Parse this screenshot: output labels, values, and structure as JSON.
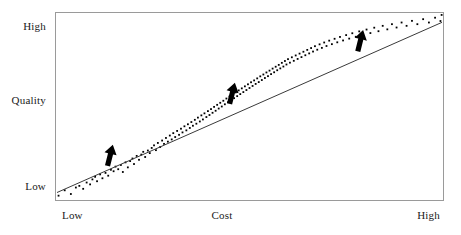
{
  "axes": {
    "y": {
      "name": "Quality",
      "high_label": "High",
      "mid_label": "Quality",
      "low_label": "Low"
    },
    "x": {
      "name": "Cost",
      "low_label": "Low",
      "mid_label": "Cost",
      "high_label": "High"
    }
  },
  "colors": {
    "frame": "#9a9a9a",
    "point": "#000000",
    "trend_line": "#3a3a3a",
    "arrow": "#000000",
    "background": "#ffffff",
    "text": "#1a1a1a"
  },
  "chart_data": {
    "type": "scatter",
    "title": "",
    "xlabel": "Cost",
    "ylabel": "Quality",
    "xlim": [
      0,
      1
    ],
    "ylim": [
      0,
      1
    ],
    "grid": false,
    "legend": null,
    "xtick_labels": [
      "Low",
      "Cost",
      "High"
    ],
    "ytick_labels": [
      "Low",
      "Quality",
      "High"
    ],
    "xtick_positions": [
      0.0,
      0.5,
      1.0
    ],
    "ytick_positions": [
      0.0,
      0.5,
      1.0
    ],
    "trend_line": {
      "x": [
        0.0,
        1.0
      ],
      "y": [
        0.035,
        0.955
      ],
      "slope": 0.92,
      "intercept": 0.035
    },
    "annotations": [
      {
        "label": "arrow-up-1",
        "x": 0.135,
        "y": 0.21,
        "direction": "up-right"
      },
      {
        "label": "arrow-up-2",
        "x": 0.452,
        "y": 0.545,
        "direction": "up-right"
      },
      {
        "label": "arrow-up-3",
        "x": 0.785,
        "y": 0.83,
        "direction": "up-right"
      }
    ],
    "points": [
      [
        0.004,
        0.018
      ],
      [
        0.02,
        0.047
      ],
      [
        0.036,
        0.027
      ],
      [
        0.049,
        0.062
      ],
      [
        0.058,
        0.071
      ],
      [
        0.068,
        0.055
      ],
      [
        0.077,
        0.089
      ],
      [
        0.086,
        0.079
      ],
      [
        0.092,
        0.106
      ],
      [
        0.099,
        0.12
      ],
      [
        0.104,
        0.096
      ],
      [
        0.112,
        0.133
      ],
      [
        0.118,
        0.112
      ],
      [
        0.126,
        0.141
      ],
      [
        0.133,
        0.126
      ],
      [
        0.14,
        0.158
      ],
      [
        0.147,
        0.15
      ],
      [
        0.152,
        0.175
      ],
      [
        0.159,
        0.161
      ],
      [
        0.166,
        0.184
      ],
      [
        0.171,
        0.146
      ],
      [
        0.178,
        0.198
      ],
      [
        0.184,
        0.171
      ],
      [
        0.19,
        0.205
      ],
      [
        0.196,
        0.219
      ],
      [
        0.2,
        0.189
      ],
      [
        0.207,
        0.233
      ],
      [
        0.213,
        0.212
      ],
      [
        0.219,
        0.24
      ],
      [
        0.224,
        0.255
      ],
      [
        0.229,
        0.227
      ],
      [
        0.236,
        0.262
      ],
      [
        0.241,
        0.248
      ],
      [
        0.246,
        0.276
      ],
      [
        0.252,
        0.29
      ],
      [
        0.257,
        0.264
      ],
      [
        0.262,
        0.303
      ],
      [
        0.268,
        0.281
      ],
      [
        0.273,
        0.316
      ],
      [
        0.278,
        0.298
      ],
      [
        0.283,
        0.33
      ],
      [
        0.288,
        0.31
      ],
      [
        0.293,
        0.343
      ],
      [
        0.298,
        0.322
      ],
      [
        0.302,
        0.356
      ],
      [
        0.307,
        0.335
      ],
      [
        0.312,
        0.368
      ],
      [
        0.317,
        0.347
      ],
      [
        0.322,
        0.38
      ],
      [
        0.326,
        0.36
      ],
      [
        0.331,
        0.393
      ],
      [
        0.336,
        0.371
      ],
      [
        0.34,
        0.404
      ],
      [
        0.345,
        0.384
      ],
      [
        0.349,
        0.416
      ],
      [
        0.353,
        0.396
      ],
      [
        0.358,
        0.428
      ],
      [
        0.362,
        0.407
      ],
      [
        0.366,
        0.44
      ],
      [
        0.371,
        0.419
      ],
      [
        0.375,
        0.452
      ],
      [
        0.379,
        0.43
      ],
      [
        0.383,
        0.463
      ],
      [
        0.388,
        0.443
      ],
      [
        0.392,
        0.475
      ],
      [
        0.396,
        0.454
      ],
      [
        0.4,
        0.486
      ],
      [
        0.404,
        0.466
      ],
      [
        0.408,
        0.498
      ],
      [
        0.412,
        0.477
      ],
      [
        0.416,
        0.509
      ],
      [
        0.42,
        0.489
      ],
      [
        0.424,
        0.52
      ],
      [
        0.428,
        0.5
      ],
      [
        0.432,
        0.531
      ],
      [
        0.436,
        0.512
      ],
      [
        0.44,
        0.543
      ],
      [
        0.444,
        0.523
      ],
      [
        0.448,
        0.554
      ],
      [
        0.452,
        0.534
      ],
      [
        0.456,
        0.565
      ],
      [
        0.46,
        0.545
      ],
      [
        0.464,
        0.576
      ],
      [
        0.468,
        0.556
      ],
      [
        0.472,
        0.587
      ],
      [
        0.476,
        0.567
      ],
      [
        0.48,
        0.598
      ],
      [
        0.484,
        0.578
      ],
      [
        0.488,
        0.609
      ],
      [
        0.492,
        0.589
      ],
      [
        0.496,
        0.62
      ],
      [
        0.5,
        0.6
      ],
      [
        0.504,
        0.631
      ],
      [
        0.508,
        0.611
      ],
      [
        0.512,
        0.641
      ],
      [
        0.516,
        0.622
      ],
      [
        0.52,
        0.652
      ],
      [
        0.524,
        0.632
      ],
      [
        0.528,
        0.663
      ],
      [
        0.532,
        0.643
      ],
      [
        0.536,
        0.673
      ],
      [
        0.54,
        0.654
      ],
      [
        0.544,
        0.684
      ],
      [
        0.548,
        0.664
      ],
      [
        0.552,
        0.694
      ],
      [
        0.556,
        0.675
      ],
      [
        0.56,
        0.705
      ],
      [
        0.564,
        0.685
      ],
      [
        0.568,
        0.715
      ],
      [
        0.572,
        0.696
      ],
      [
        0.576,
        0.725
      ],
      [
        0.58,
        0.706
      ],
      [
        0.584,
        0.736
      ],
      [
        0.588,
        0.716
      ],
      [
        0.592,
        0.746
      ],
      [
        0.596,
        0.727
      ],
      [
        0.6,
        0.756
      ],
      [
        0.605,
        0.737
      ],
      [
        0.61,
        0.766
      ],
      [
        0.615,
        0.747
      ],
      [
        0.62,
        0.776
      ],
      [
        0.625,
        0.757
      ],
      [
        0.63,
        0.786
      ],
      [
        0.635,
        0.767
      ],
      [
        0.64,
        0.796
      ],
      [
        0.645,
        0.777
      ],
      [
        0.65,
        0.806
      ],
      [
        0.655,
        0.787
      ],
      [
        0.66,
        0.816
      ],
      [
        0.665,
        0.797
      ],
      [
        0.67,
        0.826
      ],
      [
        0.676,
        0.807
      ],
      [
        0.682,
        0.836
      ],
      [
        0.688,
        0.817
      ],
      [
        0.694,
        0.846
      ],
      [
        0.7,
        0.827
      ],
      [
        0.707,
        0.856
      ],
      [
        0.714,
        0.837
      ],
      [
        0.721,
        0.866
      ],
      [
        0.728,
        0.847
      ],
      [
        0.735,
        0.876
      ],
      [
        0.743,
        0.857
      ],
      [
        0.751,
        0.886
      ],
      [
        0.759,
        0.867
      ],
      [
        0.767,
        0.896
      ],
      [
        0.776,
        0.877
      ],
      [
        0.785,
        0.906
      ],
      [
        0.794,
        0.887
      ],
      [
        0.804,
        0.916
      ],
      [
        0.814,
        0.897
      ],
      [
        0.824,
        0.926
      ],
      [
        0.835,
        0.907
      ],
      [
        0.846,
        0.936
      ],
      [
        0.858,
        0.917
      ],
      [
        0.87,
        0.945
      ],
      [
        0.882,
        0.927
      ],
      [
        0.895,
        0.954
      ],
      [
        0.908,
        0.936
      ],
      [
        0.922,
        0.963
      ],
      [
        0.936,
        0.945
      ],
      [
        0.951,
        0.972
      ],
      [
        0.966,
        0.954
      ],
      [
        0.982,
        0.98
      ],
      [
        0.996,
        0.962
      ],
      [
        0.999,
        0.995
      ]
    ]
  }
}
